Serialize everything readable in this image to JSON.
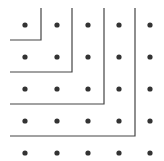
{
  "diagram": {
    "dot_color": "#333333",
    "line_color": "#444444",
    "columns_x": [
      25,
      57,
      88,
      119,
      150
    ],
    "rows_y": [
      25,
      57,
      89,
      121,
      153
    ],
    "gnomons": [
      {
        "corner_x": 41,
        "corner_y": 40,
        "top_y": 8,
        "left_x": 10
      },
      {
        "corner_x": 72,
        "corner_y": 72,
        "top_y": 8,
        "left_x": 10
      },
      {
        "corner_x": 104,
        "corner_y": 104,
        "top_y": 8,
        "left_x": 10
      },
      {
        "corner_x": 135,
        "corner_y": 136,
        "top_y": 8,
        "left_x": 10
      }
    ]
  }
}
